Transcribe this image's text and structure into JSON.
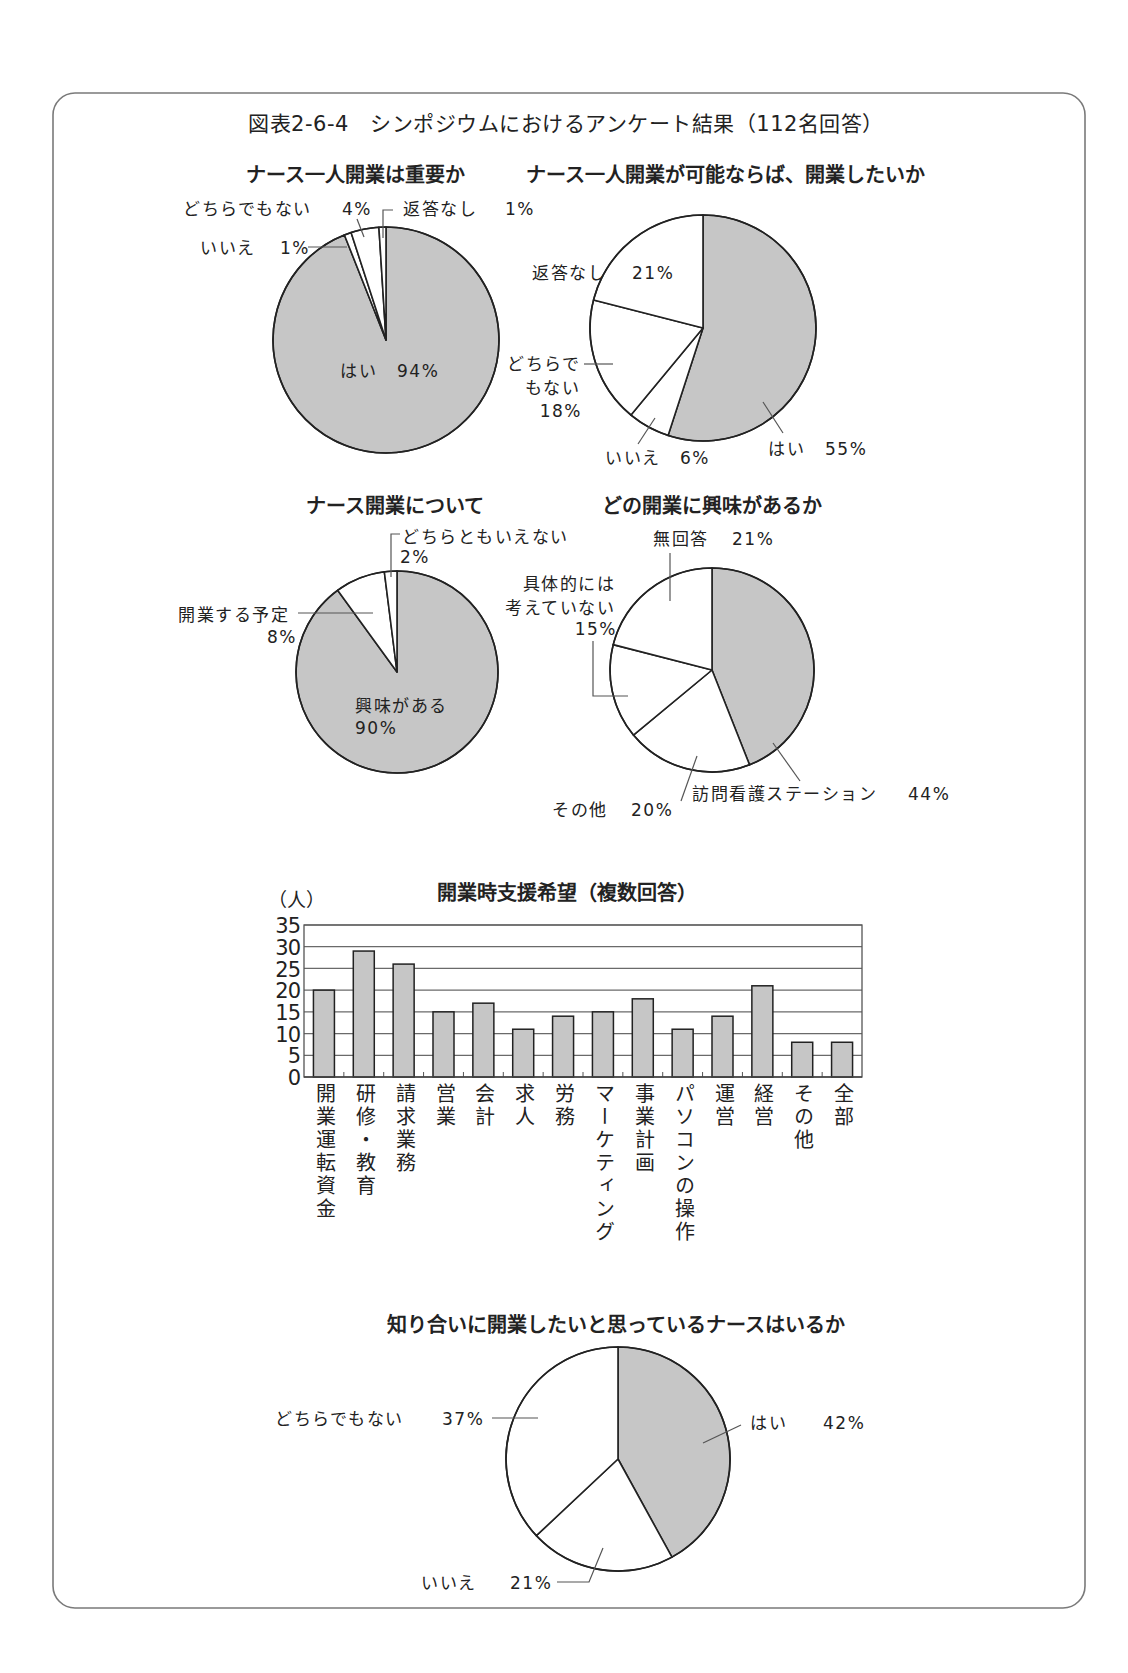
{
  "figure": {
    "title": "図表2-6-4　シンポジウムにおけるアンケート結果（112名回答）"
  },
  "colors": {
    "highlight": "#c6c6c6",
    "plain": "#ffffff",
    "stroke": "#222222",
    "frame": "#7a7a7a"
  },
  "chart_data": [
    {
      "type": "pie",
      "title": "ナース一人開業は重要か",
      "labels": [
        "はい",
        "いいえ",
        "どちらでもない",
        "返答なし"
      ],
      "values": [
        94,
        1,
        4,
        1
      ],
      "value_labels": [
        "94%",
        "1%",
        "4%",
        "1%"
      ],
      "colors": [
        "#c6c6c6",
        "#ffffff",
        "#ffffff",
        "#ffffff"
      ],
      "unit": "%",
      "start": "12 o'clock, clockwise"
    },
    {
      "type": "pie",
      "title": "ナース一人開業が可能ならば、開業したいか",
      "labels": [
        "はい",
        "いいえ",
        "どちらでもない",
        "返答なし"
      ],
      "label_lines": {
        "2": [
          "どちらで",
          "もない"
        ]
      },
      "values": [
        55,
        6,
        18,
        21
      ],
      "value_labels": [
        "55%",
        "6%",
        "18%",
        "21%"
      ],
      "colors": [
        "#c6c6c6",
        "#ffffff",
        "#ffffff",
        "#ffffff"
      ],
      "unit": "%",
      "start": "12 o'clock, clockwise"
    },
    {
      "type": "pie",
      "title": "ナース開業について",
      "labels": [
        "興味がある",
        "開業する予定",
        "どちらともいえない"
      ],
      "values": [
        90,
        8,
        2
      ],
      "value_labels": [
        "90%",
        "8%",
        "2%"
      ],
      "colors": [
        "#c6c6c6",
        "#ffffff",
        "#ffffff"
      ],
      "unit": "%",
      "start": "12 o'clock, clockwise"
    },
    {
      "type": "pie",
      "title": "どの開業に興味があるか",
      "labels": [
        "訪問看護ステーション",
        "その他",
        "具体的には考えていない",
        "無回答"
      ],
      "label_lines": {
        "2": [
          "具体的には",
          "考えていない"
        ]
      },
      "values": [
        44,
        20,
        15,
        21
      ],
      "value_labels": [
        "44%",
        "20%",
        "15%",
        "21%"
      ],
      "colors": [
        "#c6c6c6",
        "#ffffff",
        "#ffffff",
        "#ffffff"
      ],
      "unit": "%",
      "start": "12 o'clock, clockwise"
    },
    {
      "type": "bar",
      "title": "開業時支援希望（複数回答）",
      "ylabel": "（人）",
      "xlabel": "",
      "categories": [
        "開業運転資金",
        "研修・教育",
        "請求業務",
        "営業",
        "会計",
        "求人",
        "労務",
        "マーケティング",
        "事業計画",
        "パソコンの操作",
        "運営",
        "経営",
        "その他",
        "全部"
      ],
      "values": [
        20,
        29,
        26,
        15,
        17,
        11,
        14,
        15,
        18,
        11,
        14,
        21,
        8,
        8
      ],
      "ylim": [
        0,
        35
      ],
      "yticks": [
        "35",
        "30",
        "25",
        "20",
        "15",
        "10",
        "5",
        "0"
      ],
      "grid": true,
      "legend": null,
      "bar_color": "#c6c6c6"
    },
    {
      "type": "pie",
      "title": "知り合いに開業したいと思っているナースはいるか",
      "labels": [
        "はい",
        "いいえ",
        "どちらでもない"
      ],
      "values": [
        42,
        21,
        37
      ],
      "value_labels": [
        "42%",
        "21%",
        "37%"
      ],
      "colors": [
        "#c6c6c6",
        "#ffffff",
        "#ffffff"
      ],
      "unit": "%",
      "start": "12 o'clock, clockwise"
    }
  ]
}
